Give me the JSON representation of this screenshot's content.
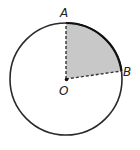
{
  "diagram": {
    "labels": {
      "a": "A",
      "b": "B",
      "o": "O"
    },
    "colors": {
      "stroke": "#2a2a2a",
      "sector_fill": "#c8c8c8",
      "background": "#ffffff"
    },
    "circle": {
      "cx": 66,
      "cy": 79,
      "r": 56
    },
    "shaded_sector": "AOB"
  }
}
